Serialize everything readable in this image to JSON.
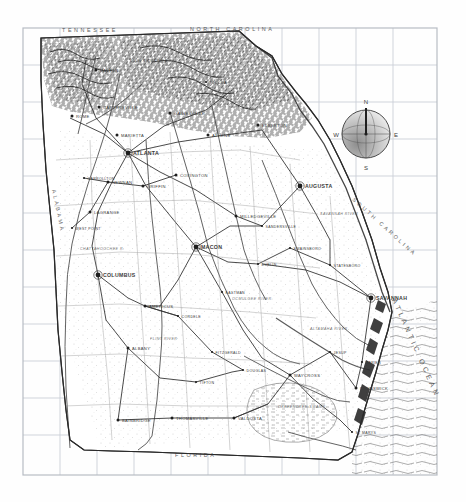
{
  "map": {
    "title": "Map of Georgia",
    "type": "historical-engraved-state-map",
    "frame": {
      "x": 23,
      "y": 28,
      "width": 414,
      "height": 447
    },
    "grid": {
      "visible": true,
      "spacing_px": 37,
      "color": "#c9cdd4"
    },
    "paper_color": "#fefefe",
    "ink_color": "#3a3a3a"
  },
  "neighbors": [
    {
      "name": "TENNESSEE",
      "x": 62,
      "y": 32,
      "rotate": 0
    },
    {
      "name": "NORTH CAROLINA",
      "x": 190,
      "y": 31,
      "rotate": 0
    },
    {
      "name": "ALABAMA",
      "x": 52,
      "y": 190,
      "rotate": 78
    },
    {
      "name": "FLORIDA",
      "x": 175,
      "y": 457,
      "rotate": 0
    },
    {
      "name": "SOUTH CAROLINA",
      "x": 352,
      "y": 200,
      "rotate": 42
    }
  ],
  "water": [
    {
      "name": "ATLANTIC OCEAN",
      "x": 392,
      "y": 300,
      "rotate": 66
    }
  ],
  "cities": [
    {
      "name": "ATLANTA",
      "x": 128,
      "y": 153,
      "size": "major"
    },
    {
      "name": "AUGUSTA",
      "x": 300,
      "y": 186,
      "size": "major"
    },
    {
      "name": "MACON",
      "x": 196,
      "y": 247,
      "size": "major"
    },
    {
      "name": "SAVANNAH",
      "x": 371,
      "y": 298,
      "size": "major"
    },
    {
      "name": "COLUMBUS",
      "x": 98,
      "y": 275,
      "size": "major"
    },
    {
      "name": "MILLEDGEVILLE",
      "x": 236,
      "y": 216,
      "size": "mid"
    },
    {
      "name": "ROME",
      "x": 72,
      "y": 116,
      "size": "mid"
    },
    {
      "name": "MARIETTA",
      "x": 117,
      "y": 135,
      "size": "mid"
    },
    {
      "name": "GAINESVILLE",
      "x": 170,
      "y": 113,
      "size": "mid"
    },
    {
      "name": "ATHENS",
      "x": 208,
      "y": 135,
      "size": "mid"
    },
    {
      "name": "ELBERTON",
      "x": 258,
      "y": 125,
      "size": "mid"
    },
    {
      "name": "COVINGTON",
      "x": 176,
      "y": 175,
      "size": "mid"
    },
    {
      "name": "GRIFFIN",
      "x": 143,
      "y": 186,
      "size": "mid"
    },
    {
      "name": "NEWNAN",
      "x": 108,
      "y": 182,
      "size": "mid"
    },
    {
      "name": "LAGRANGE",
      "x": 90,
      "y": 212,
      "size": "mid"
    },
    {
      "name": "DALTON",
      "x": 96,
      "y": 70,
      "size": "mid"
    },
    {
      "name": "CARTERSVILLE",
      "x": 99,
      "y": 107,
      "size": "mid"
    },
    {
      "name": "AMERICUS",
      "x": 145,
      "y": 306,
      "size": "mid"
    },
    {
      "name": "ALBANY",
      "x": 128,
      "y": 348,
      "size": "mid"
    },
    {
      "name": "CORDELE",
      "x": 178,
      "y": 316,
      "size": "small"
    },
    {
      "name": "DUBLIN",
      "x": 258,
      "y": 264,
      "size": "small"
    },
    {
      "name": "SWAINSBORO",
      "x": 290,
      "y": 248,
      "size": "small"
    },
    {
      "name": "STATESBORO",
      "x": 330,
      "y": 265,
      "size": "small"
    },
    {
      "name": "WAYCROSS",
      "x": 290,
      "y": 375,
      "size": "mid"
    },
    {
      "name": "BRUNSWICK",
      "x": 356,
      "y": 388,
      "size": "mid"
    },
    {
      "name": "VALDOSTA",
      "x": 234,
      "y": 418,
      "size": "mid"
    },
    {
      "name": "THOMASVILLE",
      "x": 172,
      "y": 418,
      "size": "mid"
    },
    {
      "name": "BAINBRIDGE",
      "x": 118,
      "y": 420,
      "size": "mid"
    },
    {
      "name": "FITZGERALD",
      "x": 212,
      "y": 352,
      "size": "small"
    },
    {
      "name": "TIFTON",
      "x": 196,
      "y": 382,
      "size": "small"
    },
    {
      "name": "DOUGLAS",
      "x": 243,
      "y": 370,
      "size": "small"
    },
    {
      "name": "JESUP",
      "x": 330,
      "y": 352,
      "size": "small"
    },
    {
      "name": "EASTMAN",
      "x": 222,
      "y": 292,
      "size": "small"
    },
    {
      "name": "SANDERSVILLE",
      "x": 262,
      "y": 226,
      "size": "small"
    },
    {
      "name": "DARIEN",
      "x": 362,
      "y": 362,
      "size": "small"
    },
    {
      "name": "ST MARYS",
      "x": 352,
      "y": 432,
      "size": "small"
    },
    {
      "name": "TOCCOA",
      "x": 206,
      "y": 82,
      "size": "small"
    },
    {
      "name": "CARROLLTON",
      "x": 84,
      "y": 178,
      "size": "small"
    },
    {
      "name": "WEST POINT",
      "x": 72,
      "y": 228,
      "size": "small"
    }
  ],
  "features": [
    {
      "name": "OKEFENOKEE SWAMP",
      "x": 278,
      "y": 408,
      "kind": "swamp"
    },
    {
      "name": "SAVANNAH RIVER",
      "x": 320,
      "y": 215,
      "kind": "river"
    },
    {
      "name": "CHATTAHOOCHEE R.",
      "x": 80,
      "y": 250,
      "kind": "river"
    },
    {
      "name": "FLINT RIVER",
      "x": 150,
      "y": 340,
      "kind": "river"
    },
    {
      "name": "OCMULGEE RIVER",
      "x": 232,
      "y": 300,
      "kind": "river"
    },
    {
      "name": "ALTAMAHA RIVER",
      "x": 310,
      "y": 330,
      "kind": "river"
    },
    {
      "name": "BLUE RIDGE MTS",
      "x": 130,
      "y": 62,
      "kind": "mountains"
    }
  ],
  "compass": {
    "x": 366,
    "y": 134,
    "radius": 24,
    "north_label": "N",
    "east_label": "E",
    "south_label": "S",
    "west_label": "W",
    "shaded_quadrant": "southwest"
  },
  "legend": {
    "railroads": "railroads",
    "rivers": "rivers",
    "state_line": "state boundary"
  }
}
